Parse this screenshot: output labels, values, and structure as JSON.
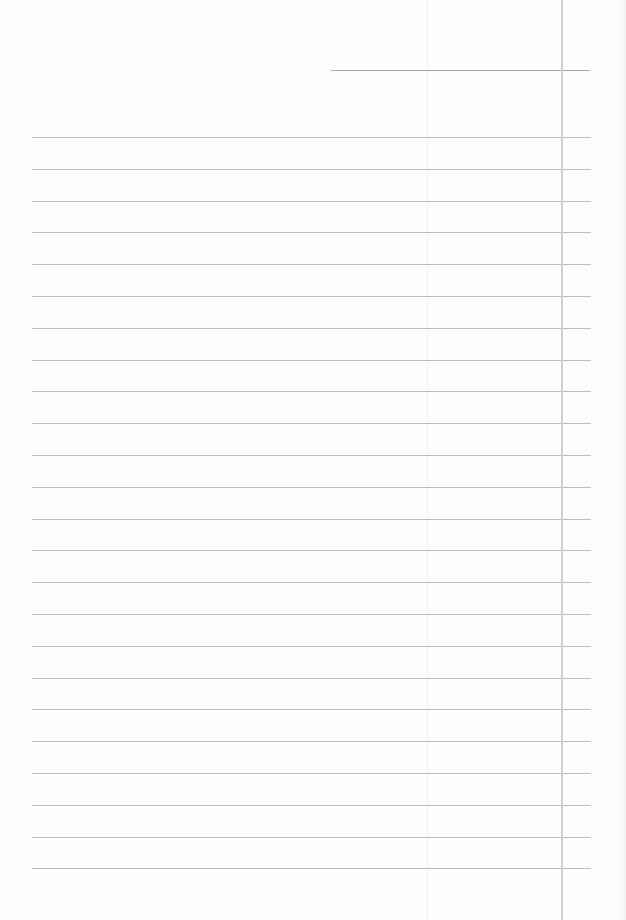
{
  "document": {
    "type": "lined-paper",
    "content": "",
    "ruled_line_count": 24,
    "has_header_line": true,
    "has_margin_line": true,
    "colors": {
      "paper": "#fefefe",
      "rule": "#bdbdbd",
      "margin": "#cfcfcf"
    }
  }
}
